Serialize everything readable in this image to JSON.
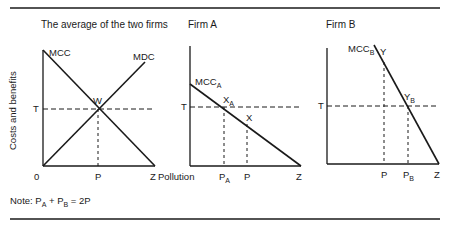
{
  "figure": {
    "panels": [
      {
        "title": "The average of the two firms",
        "y_axis_label": "Costs and benefits",
        "curves": {
          "mcc": "MCC",
          "mdc": "MDC"
        },
        "points": {
          "w": "W"
        },
        "axis_labels": {
          "t": "T",
          "origin": "0",
          "p": "P",
          "z": "Z"
        }
      },
      {
        "title": "Firm A",
        "x_axis_label": "Pollution",
        "curves": {
          "mcc": "MCC",
          "mcc_sub": "A"
        },
        "points": {
          "xa": "X",
          "xa_sub": "A",
          "x": "X"
        },
        "axis_labels": {
          "t": "T",
          "pa": "P",
          "pa_sub": "A",
          "p": "P",
          "z": "Z"
        }
      },
      {
        "title": "Firm B",
        "curves": {
          "mcc": "MCC",
          "mcc_sub": "B"
        },
        "points": {
          "y": "Y",
          "yb": "Y",
          "yb_sub": "B"
        },
        "axis_labels": {
          "t": "T",
          "p": "P",
          "pb": "P",
          "pb_sub": "B",
          "z": "Z"
        }
      }
    ],
    "note": {
      "prefix": "Note: ",
      "p1": "P",
      "p1_sub": "A",
      "plus": " + ",
      "p2": "P",
      "p2_sub": "B",
      "eq": " = 2P"
    }
  }
}
